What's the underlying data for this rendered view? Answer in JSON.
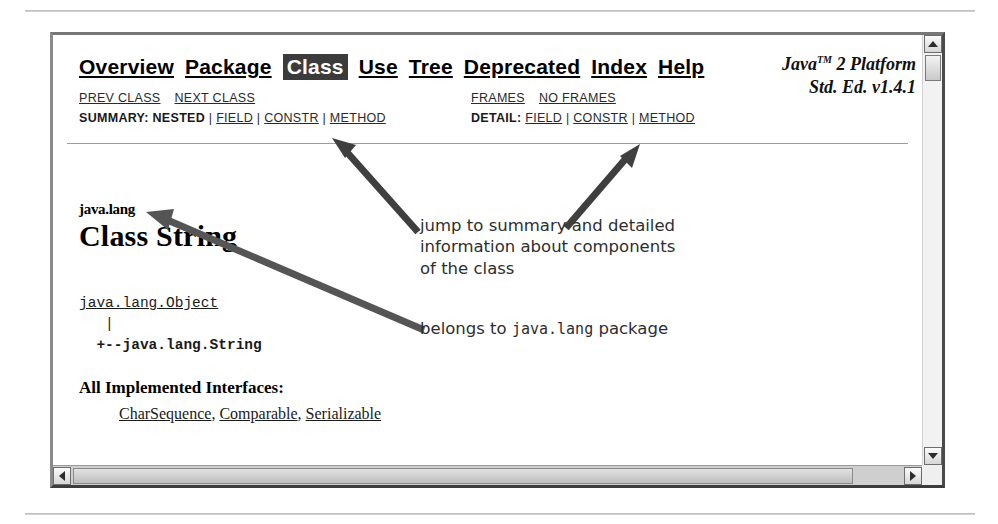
{
  "window": {
    "scrollbars": {
      "vertical": {
        "up_icon": "triangle-up-icon",
        "down_icon": "triangle-down-icon",
        "thumb": "scroll-thumb"
      },
      "horizontal": {
        "left_icon": "triangle-left-icon",
        "right_icon": "triangle-right-icon",
        "thumb": "scroll-thumb"
      }
    }
  },
  "navbar": {
    "items": [
      {
        "label": "Overview",
        "current": false
      },
      {
        "label": "Package",
        "current": false
      },
      {
        "label": "Class",
        "current": true
      },
      {
        "label": "Use",
        "current": false
      },
      {
        "label": "Tree",
        "current": false
      },
      {
        "label": "Deprecated",
        "current": false
      },
      {
        "label": "Index",
        "current": false
      },
      {
        "label": "Help",
        "current": false
      }
    ]
  },
  "brand": {
    "line1_pre": "Java",
    "line1_tm": "TM",
    "line1_post": " 2 Platform",
    "line2": "Std. Ed. v1.4.1"
  },
  "subnav": {
    "prev_class": "PREV CLASS",
    "next_class": "NEXT CLASS",
    "frames": "FRAMES",
    "no_frames": "NO FRAMES",
    "summary_label": "SUMMARY:",
    "summary_nested": "NESTED",
    "summary_field": "FIELD",
    "summary_constr": "CONSTR",
    "summary_method": "METHOD",
    "detail_label": "DETAIL:",
    "detail_field": "FIELD",
    "detail_constr": "CONSTR",
    "detail_method": "METHOD",
    "separator": " | "
  },
  "doc": {
    "package_name": "java.lang",
    "class_title": "Class String",
    "hierarchy_parent": "java.lang.Object",
    "hierarchy_pipe": "   |",
    "hierarchy_child": "  +--java.lang.String",
    "implemented_heading": "All Implemented Interfaces:",
    "implemented_interfaces": [
      "CharSequence",
      "Comparable",
      "Serializable"
    ],
    "implemented_separator": ", "
  },
  "annotations": [
    {
      "id": "annot-summary",
      "text": "jump to summary and detailed\ninformation about components\nof the class"
    },
    {
      "id": "annot-package",
      "prefix": "belongs to ",
      "code": "java.lang",
      "suffix": " package"
    }
  ],
  "colors": {
    "highlight_bg": "#3b3b3b",
    "highlight_fg": "#ffffff",
    "annotation": "#2e2e2e",
    "arrow": "#3f3f3f",
    "rule": "#b8b8b8"
  }
}
